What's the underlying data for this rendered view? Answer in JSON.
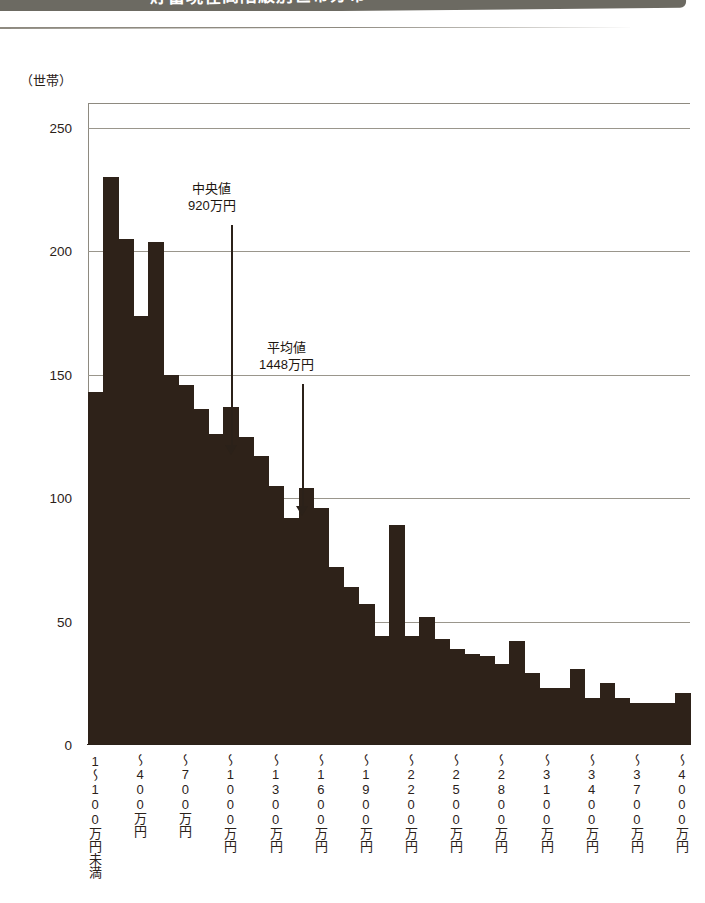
{
  "banner": {
    "title": "貯蓄現在高階級別世帯分布",
    "color": "#6c6a62"
  },
  "unit_caption": "（世帯）",
  "colors": {
    "bar": "#2e2219",
    "axis": "#2b2119",
    "grid": "#9a968c",
    "background": "#ffffff"
  },
  "annotations": [
    {
      "name": "median",
      "line1": "中央値",
      "line2": "920万円",
      "text_left": 188,
      "text_top": 181,
      "stem_left": 231,
      "stem_top": 225,
      "stem_height": 222,
      "head_top": 445
    },
    {
      "name": "mean",
      "line1": "平均値",
      "line2": "1448万円",
      "text_left": 259,
      "text_top": 340,
      "stem_left": 302,
      "stem_top": 384,
      "stem_height": 125,
      "head_top": 506
    }
  ],
  "chart_data": {
    "type": "bar",
    "title": "貯蓄現在高階級別世帯分布",
    "subtitle": "",
    "xlabel": "",
    "ylabel": "（世帯）",
    "ylim": [
      0,
      260
    ],
    "yticks": [
      0,
      50,
      100,
      150,
      200,
      250
    ],
    "grid": true,
    "legend": null,
    "bar_count": 40,
    "x_tick_labels": [
      "1～100万円未満",
      "～400万円",
      "～700万円",
      "～1000万円",
      "～1300万円",
      "～1600万円",
      "～1900万円",
      "～2200万円",
      "～2500万円",
      "～2800万円",
      "～3100万円",
      "～3400万円",
      "～3700万円",
      "～4000万円"
    ],
    "x_tick_bar_index": [
      0,
      3,
      6,
      9,
      12,
      15,
      18,
      21,
      24,
      27,
      30,
      33,
      36,
      39
    ],
    "values": [
      143,
      230,
      205,
      174,
      204,
      150,
      146,
      136,
      126,
      137,
      125,
      117,
      105,
      92,
      104,
      96,
      72,
      64,
      57,
      44,
      89,
      44,
      52,
      43,
      39,
      37,
      36,
      33,
      42,
      29,
      23,
      23,
      31,
      19,
      25,
      19,
      17,
      17,
      17,
      21
    ],
    "statistics": {
      "median_label": "中央値",
      "median_value": "920万円",
      "mean_label": "平均値",
      "mean_value": "1448万円"
    }
  }
}
